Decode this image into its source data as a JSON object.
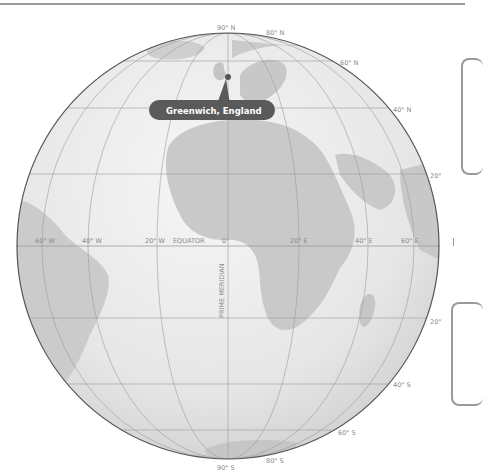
{
  "map": {
    "title": "Globe showing Prime Meridian and Equator",
    "callout": {
      "label": "Greenwich, England"
    },
    "latitude_labels": {
      "north_pole": "90° N",
      "n80": "80° N",
      "n60": "60° N",
      "n40": "40° N",
      "n20": "20°",
      "s20": "20°",
      "s40": "40° S",
      "s60": "60° S",
      "s80": "80° S",
      "south_pole": "90° S"
    },
    "longitude_labels": {
      "w60": "60° W",
      "w40": "40° W",
      "w20": "20° W",
      "equator": "EQUATOR",
      "zero": "0°",
      "e20": "20° E",
      "e40": "40° E",
      "e60": "60° E"
    },
    "prime_meridian_label": "PRIME MERIDIAN",
    "colors": {
      "ocean": "#e9e9e9",
      "land": "#c9c9c9",
      "grid": "#9c9c9c",
      "outline": "#555555",
      "callout": "#5a5a5a",
      "labels": "#8a8a8a"
    }
  }
}
